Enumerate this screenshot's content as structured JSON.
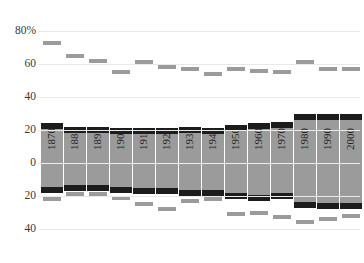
{
  "chart_data": {
    "type": "bar",
    "title": "",
    "xlabel": "",
    "ylabel": "",
    "ylim": [
      -45,
      85
    ],
    "grid": true,
    "legend": "none",
    "axis": {
      "y_ticks": [
        {
          "label": "80%",
          "value": 80
        },
        {
          "label": "60",
          "value": 60
        },
        {
          "label": "40",
          "value": 40
        },
        {
          "label": "20",
          "value": 20
        },
        {
          "label": "0",
          "value": 0
        },
        {
          "label": "20",
          "value": -20
        },
        {
          "label": "40",
          "value": -40
        }
      ]
    },
    "categories": [
      "1870",
      "1880",
      "1890",
      "1900",
      "1910",
      "1920",
      "1930",
      "1940",
      "1950",
      "1960",
      "1970",
      "1980",
      "1990",
      "2000"
    ],
    "series": [
      {
        "name": "bar-top",
        "values": [
          24,
          22,
          22,
          21,
          21,
          21,
          22,
          21,
          23,
          24,
          25,
          30,
          30,
          30
        ]
      },
      {
        "name": "bar-bottom",
        "values": [
          -18,
          -17,
          -17,
          -18,
          -19,
          -19,
          -20,
          -20,
          -22,
          -23,
          -22,
          -27,
          -28,
          -28
        ]
      },
      {
        "name": "upper-marker",
        "values": [
          73,
          65,
          62,
          55,
          61,
          58,
          57,
          54,
          57,
          56,
          55,
          61,
          57,
          57
        ]
      },
      {
        "name": "lower-marker",
        "values": [
          -22,
          -19,
          -19,
          -21,
          -25,
          -28,
          -23,
          -22,
          -31,
          -30,
          -33,
          -36,
          -34,
          -32
        ]
      }
    ]
  }
}
